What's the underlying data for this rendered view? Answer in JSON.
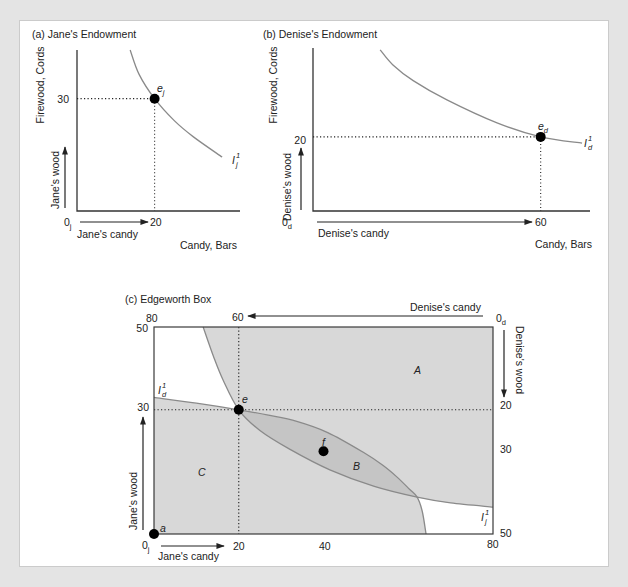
{
  "figure": {
    "colors": {
      "region_fill": "#d8d8d8",
      "lens_fill": "#c5c5c5",
      "curve": "#8a8a8a",
      "point": "#000000",
      "panel_background": "#ffffff",
      "page_background": "#e4e4e4"
    }
  },
  "chart_data": [
    {
      "type": "line",
      "title": "(a) Jane's Endowment",
      "xlabel": "Candy, Bars",
      "ylabel": "Firewood, Cords",
      "x_direction_label": "Jane's candy",
      "y_direction_label": "Jane's wood",
      "origin_label": {
        "main": "0",
        "sub": "j"
      },
      "xlim": [
        0,
        42
      ],
      "ylim": [
        0,
        43
      ],
      "grid": false,
      "x_ticks": [
        {
          "value": 20,
          "label": "20"
        }
      ],
      "y_ticks": [
        {
          "value": 30,
          "label": "30"
        }
      ],
      "points": [
        {
          "label": {
            "main": "e",
            "sub": "j"
          },
          "x": 20,
          "y": 30,
          "dotted_guides": true
        }
      ],
      "series": [
        {
          "name": {
            "main": "I",
            "sub": "j",
            "sup": "1"
          },
          "values": [
            [
              13.7,
              43
            ],
            [
              16,
              36.5
            ],
            [
              20,
              30
            ],
            [
              25,
              24.2
            ],
            [
              30,
              19.8
            ],
            [
              37.4,
              14.4
            ]
          ]
        }
      ]
    },
    {
      "type": "line",
      "title": "(b) Denise's Endowment",
      "xlabel": "Candy, Bars",
      "ylabel": "Firewood, Cords",
      "x_direction_label": "Denise's candy",
      "y_direction_label": "Denise's wood",
      "origin_label": {
        "main": "0",
        "sub": "d"
      },
      "xlim": [
        0,
        73
      ],
      "ylim": [
        0,
        44
      ],
      "grid": false,
      "x_ticks": [
        {
          "value": 60,
          "label": "60"
        }
      ],
      "y_ticks": [
        {
          "value": 20,
          "label": "20"
        }
      ],
      "points": [
        {
          "label": {
            "main": "e",
            "sub": "d"
          },
          "x": 60,
          "y": 20,
          "dotted_guides": true
        }
      ],
      "series": [
        {
          "name": {
            "main": "I",
            "sub": "d",
            "sup": "1"
          },
          "values": [
            [
              17.7,
              43.5
            ],
            [
              21,
              39.5
            ],
            [
              26.4,
              35.2
            ],
            [
              35.3,
              30
            ],
            [
              48.5,
              23.8
            ],
            [
              60,
              20
            ],
            [
              70.9,
              18.3
            ]
          ]
        }
      ]
    },
    {
      "type": "line",
      "title": "(c) Edgeworth Box",
      "xlim": [
        0,
        80
      ],
      "ylim": [
        0,
        50
      ],
      "grid": false,
      "jane_axes": {
        "origin_label": {
          "main": "0",
          "sub": "j"
        },
        "x_direction_label": "Jane's candy",
        "y_direction_label": "Jane's wood",
        "x_ticks": [
          {
            "value": 20,
            "label": "20"
          },
          {
            "value": 40,
            "label": "40"
          },
          {
            "value": 80,
            "label": "80"
          }
        ],
        "y_ticks": [
          {
            "value": 30,
            "label": "30"
          },
          {
            "value": 50,
            "label": "50"
          }
        ]
      },
      "denise_axes": {
        "origin_label": {
          "main": "0",
          "sub": "d"
        },
        "x_direction_label": "Denise's candy",
        "y_direction_label": "Denise's wood",
        "x_ticks": [
          {
            "jane_value": 0,
            "label": "80"
          },
          {
            "jane_value": 20,
            "label": "60"
          }
        ],
        "y_ticks": [
          {
            "jane_value": 30,
            "label": "20"
          },
          {
            "jane_value": 20,
            "label": "30"
          },
          {
            "jane_value": 0,
            "label": "50"
          }
        ]
      },
      "points": [
        {
          "label": "a",
          "x": 0,
          "y": 0
        },
        {
          "label": "e",
          "x": 20,
          "y": 30
        },
        {
          "label": "f",
          "x": 40,
          "y": 20
        }
      ],
      "dotted_guides": {
        "x": 20,
        "y": 30
      },
      "regions": [
        {
          "label": "A"
        },
        {
          "label": "B"
        },
        {
          "label": "C"
        }
      ],
      "series": [
        {
          "name": {
            "main": "I",
            "sub": "d",
            "sup": "1"
          },
          "values": [
            [
              0,
              33
            ],
            [
              10,
              31.6
            ],
            [
              20,
              30
            ],
            [
              27,
              28.7
            ],
            [
              33.7,
              27.2
            ],
            [
              41,
              24.5
            ],
            [
              49.3,
              19.8
            ],
            [
              54,
              16.6
            ],
            [
              57.3,
              13.8
            ],
            [
              60.3,
              10.8
            ],
            [
              62.1,
              8.9
            ],
            [
              63.3,
              5.5
            ],
            [
              64.2,
              0
            ]
          ]
        },
        {
          "name": {
            "main": "I",
            "sub": "j",
            "sup": "1"
          },
          "values": [
            [
              11.6,
              50
            ],
            [
              14,
              43
            ],
            [
              16.3,
              37.2
            ],
            [
              20,
              30
            ],
            [
              25,
              25
            ],
            [
              32,
              20.5
            ],
            [
              41.5,
              15.5
            ],
            [
              52,
              11.5
            ],
            [
              62.1,
              8.9
            ],
            [
              70,
              7.5
            ],
            [
              80,
              6.5
            ]
          ]
        }
      ],
      "curve_intersections": [
        [
          20,
          30
        ],
        [
          62.1,
          8.9
        ]
      ]
    }
  ]
}
